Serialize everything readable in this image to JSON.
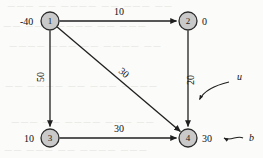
{
  "figure": {
    "kind": "directed-network-flow-graph",
    "background_color": "#fbfbf9",
    "node_fill_color": "#c9c9c9",
    "node_stroke_color": "#2b2b2b",
    "edge_color": "#1f1f1f"
  },
  "nodes": [
    {
      "id": "1",
      "label": "1",
      "supply": "-40",
      "cx": 50,
      "cy": 21,
      "r": 9
    },
    {
      "id": "2",
      "label": "2",
      "supply": "0",
      "cx": 188,
      "cy": 21,
      "r": 9
    },
    {
      "id": "3",
      "label": "3",
      "supply": "10",
      "cx": 50,
      "cy": 138,
      "r": 9
    },
    {
      "id": "4",
      "label": "4",
      "supply": "30",
      "cx": 188,
      "cy": 138,
      "r": 9
    }
  ],
  "edges": [
    {
      "id": "e12",
      "from": "1",
      "to": "2",
      "cost": "10",
      "orientation": "horizontal"
    },
    {
      "id": "e13",
      "from": "1",
      "to": "3",
      "cost": "50",
      "orientation": "vertical"
    },
    {
      "id": "e14",
      "from": "1",
      "to": "4",
      "cost": "30",
      "orientation": "diagonal"
    },
    {
      "id": "e24",
      "from": "2",
      "to": "4",
      "cost": "20",
      "orientation": "vertical"
    },
    {
      "id": "e34",
      "from": "3",
      "to": "4",
      "cost": "30",
      "orientation": "horizontal"
    }
  ],
  "annotations": [
    {
      "id": "u",
      "label": "u",
      "points_to": "edge-label-20",
      "description": "curved arrow from u to the arc cost 20"
    },
    {
      "id": "b",
      "label": "b",
      "points_to": "node-supply-4",
      "description": "curved arrow from b to the node supply 30"
    }
  ],
  "ghost_text": {
    "note": "faint illegible show-through text from the reverse of the page",
    "lines": [
      "—— ——— —— ———— —— ———",
      "——— —— ———— ——— ——",
      "—— ———— —— ——— ————",
      "———— ——— —— ———— ——",
      "—— ——— ———— —— ———",
      "——— ———— —— ——— ——"
    ]
  }
}
